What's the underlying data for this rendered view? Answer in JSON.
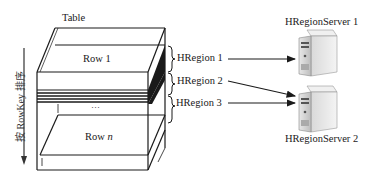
{
  "diagram": {
    "table_label": "Table",
    "sort_label": "按 RowKey 排序",
    "rows": [
      {
        "prefix": "Row",
        "index": "1"
      },
      {
        "ellipsis": "···"
      },
      {
        "prefix": "Row",
        "index": "n"
      }
    ],
    "regions": [
      {
        "label": "HRegion 1",
        "target": "HRegionServer 1"
      },
      {
        "label": "HRegion 2",
        "target": "HRegionServer 2"
      },
      {
        "label": "HRegion 3",
        "target": "HRegionServer 2"
      }
    ],
    "servers": [
      {
        "label": "HRegionServer 1",
        "icon": "server-tower-icon"
      },
      {
        "label": "HRegionServer 2",
        "icon": "server-tower-icon"
      }
    ]
  }
}
